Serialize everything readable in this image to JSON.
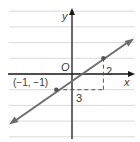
{
  "diagram": {
    "type": "coordinate-plane-line",
    "grid": {
      "x_min": -4,
      "x_max": 4,
      "y_min": -4,
      "y_max": 4,
      "cell_px": 15.7
    },
    "axes": {
      "x_label": "x",
      "y_label": "y",
      "origin_label": "O"
    },
    "line": {
      "points": [
        [
          -1,
          -1
        ],
        [
          2,
          1
        ]
      ],
      "slope": "2/3",
      "arrow_start": [
        -4,
        -3.2
      ],
      "arrow_end": [
        3.9,
        2.2
      ]
    },
    "point_label": "(−1, −1)",
    "run_label": "3",
    "rise_label": "2",
    "colors": {
      "grid": "#d9d9d9",
      "axis": "#1a1a1a",
      "line": "#6e6e6e",
      "dash": "#555555",
      "text": "#3a3a3a"
    }
  }
}
